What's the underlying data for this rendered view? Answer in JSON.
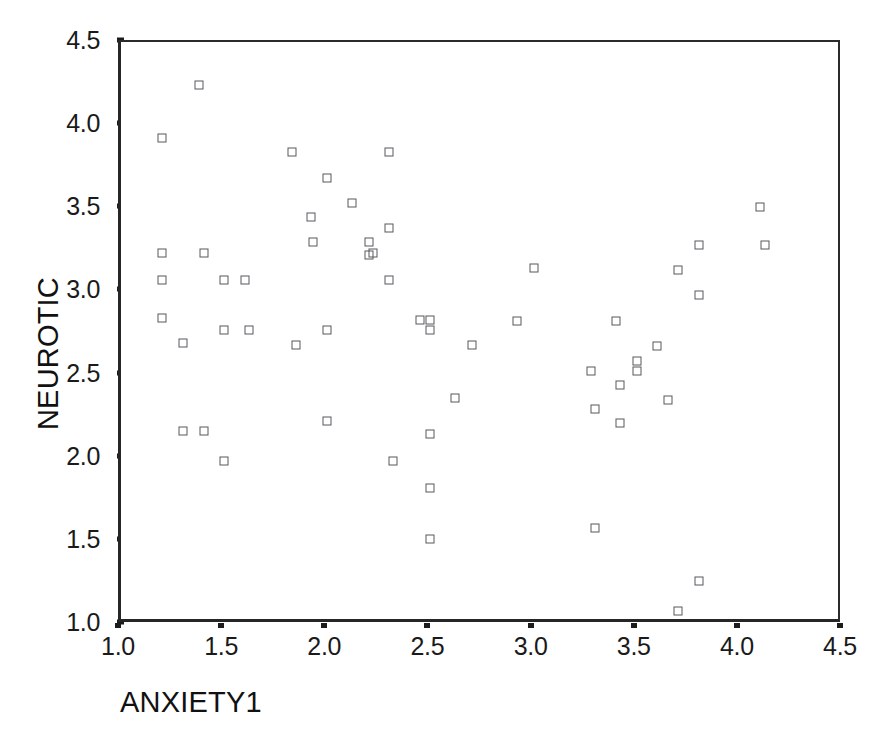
{
  "chart_data": {
    "type": "scatter",
    "title": "",
    "xlabel": "ANXIETY1",
    "ylabel": "NEUROTIC",
    "xlim": [
      1.0,
      4.5
    ],
    "ylim": [
      1.0,
      4.5
    ],
    "xticks": [
      "1.0",
      "1.5",
      "2.0",
      "2.5",
      "3.0",
      "3.5",
      "4.0",
      "4.5"
    ],
    "xtick_values": [
      1.0,
      1.5,
      2.0,
      2.5,
      3.0,
      3.5,
      4.0,
      4.5
    ],
    "yticks": [
      "1.0",
      "1.5",
      "2.0",
      "2.5",
      "3.0",
      "3.5",
      "4.0",
      "4.5"
    ],
    "ytick_values": [
      1.0,
      1.5,
      2.0,
      2.5,
      3.0,
      3.5,
      4.0,
      4.5
    ],
    "grid": false,
    "legend": false,
    "legend_position": "none",
    "marker": "open-square",
    "marker_color": "#58585c",
    "n_points": 63,
    "points": [
      [
        1.2,
        3.92
      ],
      [
        1.2,
        3.23
      ],
      [
        1.2,
        3.07
      ],
      [
        1.2,
        2.84
      ],
      [
        1.3,
        2.69
      ],
      [
        1.3,
        2.16
      ],
      [
        1.38,
        4.24
      ],
      [
        1.4,
        3.23
      ],
      [
        1.4,
        2.16
      ],
      [
        1.5,
        3.07
      ],
      [
        1.5,
        2.77
      ],
      [
        1.5,
        1.98
      ],
      [
        1.6,
        3.07
      ],
      [
        1.62,
        2.77
      ],
      [
        1.83,
        3.84
      ],
      [
        1.85,
        2.68
      ],
      [
        1.92,
        3.45
      ],
      [
        1.93,
        3.3
      ],
      [
        2.0,
        3.68
      ],
      [
        2.0,
        2.77
      ],
      [
        2.0,
        2.22
      ],
      [
        2.12,
        3.53
      ],
      [
        2.2,
        3.3
      ],
      [
        2.2,
        3.22
      ],
      [
        2.22,
        3.23
      ],
      [
        2.3,
        3.84
      ],
      [
        2.3,
        3.38
      ],
      [
        2.3,
        3.07
      ],
      [
        2.32,
        1.98
      ],
      [
        2.45,
        2.83
      ],
      [
        2.5,
        2.83
      ],
      [
        2.5,
        2.77
      ],
      [
        2.5,
        2.14
      ],
      [
        2.5,
        1.82
      ],
      [
        2.5,
        1.51
      ],
      [
        2.62,
        2.36
      ],
      [
        2.7,
        2.68
      ],
      [
        2.92,
        2.82
      ],
      [
        3.0,
        3.14
      ],
      [
        3.28,
        2.52
      ],
      [
        3.3,
        2.29
      ],
      [
        3.3,
        1.58
      ],
      [
        3.4,
        2.82
      ],
      [
        3.42,
        2.44
      ],
      [
        3.42,
        2.21
      ],
      [
        3.5,
        2.58
      ],
      [
        3.5,
        2.52
      ],
      [
        3.6,
        2.67
      ],
      [
        3.65,
        2.35
      ],
      [
        3.7,
        3.13
      ],
      [
        3.7,
        1.08
      ],
      [
        3.8,
        3.28
      ],
      [
        3.8,
        2.98
      ],
      [
        3.8,
        1.26
      ],
      [
        4.1,
        3.51
      ],
      [
        4.12,
        3.28
      ]
    ]
  },
  "figure": {
    "background_color": "#ffffff",
    "frame_color": "#262626",
    "text_color": "#1a1a1a"
  }
}
